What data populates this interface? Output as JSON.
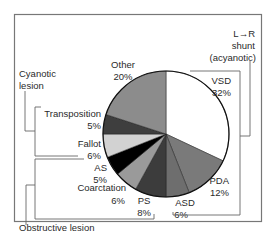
{
  "chart_data": {
    "type": "pie",
    "title": "",
    "center": [
      166,
      134
    ],
    "radius": 63,
    "start_angle_deg": -90,
    "direction": "clockwise",
    "slices": [
      {
        "key": "vsd",
        "label": "VSD",
        "value": 32,
        "value_label": "32%",
        "color": "#ffffff",
        "label_pos": [
          231,
          84
        ],
        "value_pos": [
          231,
          96
        ],
        "anchor": "end"
      },
      {
        "key": "pda",
        "label": "PDA",
        "value": 12,
        "value_label": "12%",
        "color": "#7a7a7a",
        "label_pos": [
          229,
          184
        ],
        "value_pos": [
          229,
          196
        ],
        "anchor": "end"
      },
      {
        "key": "asd",
        "label": "ASD",
        "value": 6,
        "value_label": "6%",
        "color": "#6e6e6e",
        "label_pos": [
          185,
          206
        ],
        "value_pos": [
          181,
          218
        ],
        "anchor": "middle"
      },
      {
        "key": "ps",
        "label": "PS",
        "value": 8,
        "value_label": "8%",
        "color": "#3c3c3c",
        "label_pos": [
          144,
          204
        ],
        "value_pos": [
          144,
          216
        ],
        "anchor": "middle"
      },
      {
        "key": "coarctation",
        "label": "Coarctation",
        "value": 6,
        "value_label": "6%",
        "color": "#9a9a9a",
        "label_pos": [
          126,
          191
        ],
        "value_pos": [
          125,
          204
        ],
        "anchor": "end"
      },
      {
        "key": "as",
        "label": "AS",
        "value": 5,
        "value_label": "5%",
        "color": "#000000",
        "label_pos": [
          107,
          171
        ],
        "value_pos": [
          107,
          183
        ],
        "anchor": "end"
      },
      {
        "key": "fallot",
        "label": "Fallot",
        "value": 6,
        "value_label": "6%",
        "color": "#d2d2d2",
        "label_pos": [
          101,
          147
        ],
        "value_pos": [
          101,
          159
        ],
        "anchor": "end"
      },
      {
        "key": "transposition",
        "label": "Transposition",
        "value": 5,
        "value_label": "5%",
        "color": "#3e3e3e",
        "label_pos": [
          101,
          117
        ],
        "value_pos": [
          101,
          129
        ],
        "anchor": "end"
      },
      {
        "key": "other",
        "label": "Other",
        "value": 20,
        "value_label": "20%",
        "color": "#8c8c8c",
        "label_pos": [
          123,
          68
        ],
        "value_pos": [
          123,
          80
        ],
        "anchor": "middle"
      }
    ],
    "groups": [
      {
        "key": "lr-shunt",
        "lines": [
          "L→R",
          "shunt",
          "(acyanotic)"
        ],
        "members": [
          "VSD",
          "PDA",
          "ASD"
        ]
      },
      {
        "key": "cyanotic",
        "lines": [
          "Cyanotic",
          "lesion"
        ],
        "members": [
          "Transposition",
          "Fallot"
        ]
      },
      {
        "key": "obstructive",
        "lines": [
          "Obstructive lesion"
        ],
        "members": [
          "AS",
          "Coarctation",
          "PS"
        ]
      }
    ]
  },
  "group_labels": {
    "lr_shunt_1": "L→R",
    "lr_shunt_2": "shunt",
    "lr_shunt_3": "(acyanotic)",
    "cyanotic_1": "Cyanotic",
    "cyanotic_2": "lesion",
    "obstructive": "Obstructive lesion"
  },
  "colors": {
    "frame": "#777777",
    "bracket": "#666666",
    "pie_outline": "#111111",
    "text": "#2a2a2a"
  }
}
